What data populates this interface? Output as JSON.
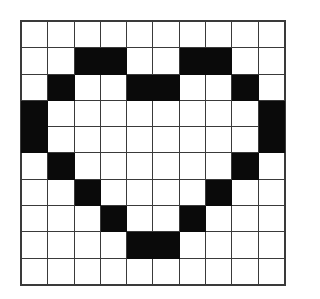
{
  "figure": {
    "kind": "grid-pixel-art",
    "rows": 10,
    "columns": 10,
    "filled_color": "#0a0a0a",
    "empty_color": "#ffffff",
    "gridline_color": "#3a3a3a",
    "background_color": "#ffffff"
  },
  "chart_data": {
    "type": "heatmap",
    "xlabel": "",
    "ylabel": "",
    "categories": [
      "0",
      "1",
      "2",
      "3",
      "4",
      "5",
      "6",
      "7",
      "8",
      "9"
    ],
    "row_labels": [
      "0",
      "1",
      "2",
      "3",
      "4",
      "5",
      "6",
      "7",
      "8",
      "9"
    ],
    "legend": [],
    "grid": true,
    "values": [
      [
        0,
        0,
        0,
        0,
        0,
        0,
        0,
        0,
        0,
        0
      ],
      [
        0,
        0,
        1,
        1,
        0,
        0,
        1,
        1,
        0,
        0
      ],
      [
        0,
        1,
        0,
        0,
        1,
        1,
        0,
        0,
        1,
        0
      ],
      [
        1,
        0,
        0,
        0,
        0,
        0,
        0,
        0,
        0,
        1
      ],
      [
        1,
        0,
        0,
        0,
        0,
        0,
        0,
        0,
        0,
        1
      ],
      [
        0,
        1,
        0,
        0,
        0,
        0,
        0,
        0,
        1,
        0
      ],
      [
        0,
        0,
        1,
        0,
        0,
        0,
        0,
        1,
        0,
        0
      ],
      [
        0,
        0,
        0,
        1,
        0,
        0,
        1,
        0,
        0,
        0
      ],
      [
        0,
        0,
        0,
        0,
        1,
        1,
        0,
        0,
        0,
        0
      ],
      [
        0,
        0,
        0,
        0,
        0,
        0,
        0,
        0,
        0,
        0
      ]
    ],
    "filled_count": 24,
    "colorscale": {
      "0": "#ffffff",
      "1": "#0a0a0a"
    }
  }
}
